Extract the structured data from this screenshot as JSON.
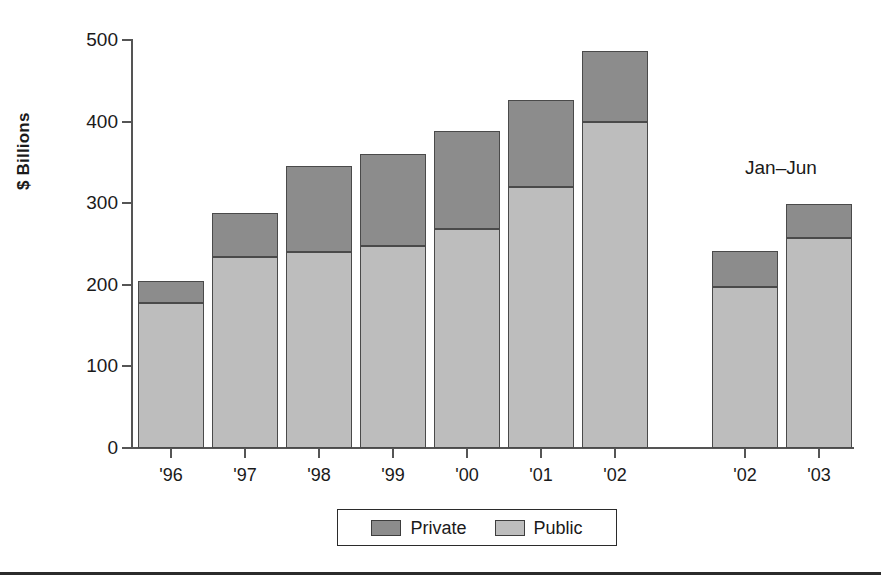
{
  "chart_data": {
    "type": "bar",
    "subtype": "stacked",
    "title": "",
    "xlabel": "",
    "ylabel": "$ Billions",
    "ylim": [
      0,
      500
    ],
    "yticks": [
      0,
      100,
      200,
      300,
      400,
      500
    ],
    "grid": false,
    "legend_position": "bottom-center",
    "categories": [
      "'96",
      "'97",
      "'98",
      "'99",
      "'00",
      "'01",
      "'02",
      "'02",
      "'03"
    ],
    "groups": [
      {
        "name": "Full year",
        "categories": [
          "'96",
          "'97",
          "'98",
          "'99",
          "'00",
          "'01",
          "'02"
        ]
      },
      {
        "name": "Jan-Jun",
        "categories": [
          "'02",
          "'03"
        ]
      }
    ],
    "series": [
      {
        "name": "Public",
        "color": "#bdbdbd",
        "values": [
          178,
          234,
          240,
          247,
          268,
          320,
          400,
          197,
          257
        ]
      },
      {
        "name": "Private",
        "color": "#8c8c8c",
        "values": [
          27,
          54,
          105,
          113,
          121,
          106,
          87,
          44,
          42
        ]
      }
    ],
    "totals": [
      205,
      288,
      345,
      360,
      389,
      426,
      487,
      241,
      299
    ],
    "annotations": [
      {
        "text": "Jan–Jun",
        "target": "right-group"
      }
    ]
  },
  "axes": {
    "y_label": "$ Billions",
    "y_ticks": [
      "500",
      "400",
      "300",
      "200",
      "100",
      "0"
    ],
    "x_ticks": [
      "'96",
      "'97",
      "'98",
      "'99",
      "'00",
      "'01",
      "'02",
      "'02",
      "'03"
    ]
  },
  "legend": {
    "items": [
      {
        "label": "Private",
        "color": "#8c8c8c"
      },
      {
        "label": "Public",
        "color": "#bdbdbd"
      }
    ]
  },
  "annotation": {
    "text": "Jan–Jun"
  }
}
